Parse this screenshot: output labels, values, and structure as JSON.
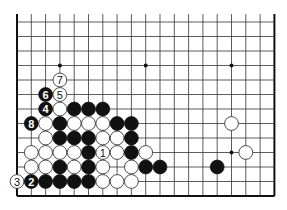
{
  "diagram": {
    "type": "go-board-partial",
    "columns": 19,
    "rows_visible": 13,
    "open_edge": "top",
    "grid": {
      "x0": 17,
      "y0": 22,
      "dx": 14.3,
      "dy": 14.5,
      "top_line_stub_y": 14
    },
    "colors": {
      "line": "#333333",
      "edge": "#111111",
      "black": "#111111",
      "white": "#ffffff",
      "white_stroke": "#222222"
    },
    "star_points": [
      [
        3,
        3
      ],
      [
        9,
        3
      ],
      [
        15,
        3
      ],
      [
        15,
        9
      ]
    ],
    "stones": [
      {
        "c": 3,
        "r": 4,
        "color": "white",
        "label": "7"
      },
      {
        "c": 2,
        "r": 5,
        "color": "black",
        "label": "6"
      },
      {
        "c": 3,
        "r": 5,
        "color": "white",
        "label": "5"
      },
      {
        "c": 2,
        "r": 6,
        "color": "black",
        "label": "4"
      },
      {
        "c": 3,
        "r": 6,
        "color": "white",
        "label": ""
      },
      {
        "c": 4,
        "r": 6,
        "color": "black",
        "label": ""
      },
      {
        "c": 5,
        "r": 6,
        "color": "black",
        "label": ""
      },
      {
        "c": 6,
        "r": 6,
        "color": "black",
        "label": ""
      },
      {
        "c": 1,
        "r": 7,
        "color": "black",
        "label": "8"
      },
      {
        "c": 2,
        "r": 7,
        "color": "white",
        "label": ""
      },
      {
        "c": 3,
        "r": 7,
        "color": "black",
        "label": ""
      },
      {
        "c": 4,
        "r": 7,
        "color": "white",
        "label": ""
      },
      {
        "c": 5,
        "r": 7,
        "color": "white",
        "label": ""
      },
      {
        "c": 6,
        "r": 7,
        "color": "white",
        "label": ""
      },
      {
        "c": 7,
        "r": 7,
        "color": "black",
        "label": ""
      },
      {
        "c": 8,
        "r": 7,
        "color": "black",
        "label": ""
      },
      {
        "c": 15,
        "r": 7,
        "color": "white",
        "label": ""
      },
      {
        "c": 2,
        "r": 8,
        "color": "white",
        "label": ""
      },
      {
        "c": 3,
        "r": 8,
        "color": "black",
        "label": ""
      },
      {
        "c": 4,
        "r": 8,
        "color": "black",
        "label": ""
      },
      {
        "c": 5,
        "r": 8,
        "color": "black",
        "label": ""
      },
      {
        "c": 6,
        "r": 8,
        "color": "white",
        "label": ""
      },
      {
        "c": 7,
        "r": 8,
        "color": "white",
        "label": ""
      },
      {
        "c": 8,
        "r": 8,
        "color": "black",
        "label": ""
      },
      {
        "c": 1,
        "r": 9,
        "color": "white",
        "label": ""
      },
      {
        "c": 2,
        "r": 9,
        "color": "white",
        "label": ""
      },
      {
        "c": 3,
        "r": 9,
        "color": "white",
        "label": ""
      },
      {
        "c": 4,
        "r": 9,
        "color": "white",
        "label": ""
      },
      {
        "c": 5,
        "r": 9,
        "color": "black",
        "label": ""
      },
      {
        "c": 6,
        "r": 9,
        "color": "white",
        "label": "1"
      },
      {
        "c": 7,
        "r": 9,
        "color": "white",
        "label": ""
      },
      {
        "c": 8,
        "r": 9,
        "color": "black",
        "label": ""
      },
      {
        "c": 9,
        "r": 9,
        "color": "white",
        "label": ""
      },
      {
        "c": 16,
        "r": 9,
        "color": "white",
        "label": ""
      },
      {
        "c": 1,
        "r": 10,
        "color": "white",
        "label": ""
      },
      {
        "c": 2,
        "r": 10,
        "color": "white",
        "label": ""
      },
      {
        "c": 3,
        "r": 10,
        "color": "black",
        "label": ""
      },
      {
        "c": 4,
        "r": 10,
        "color": "white",
        "label": ""
      },
      {
        "c": 5,
        "r": 10,
        "color": "black",
        "label": ""
      },
      {
        "c": 6,
        "r": 10,
        "color": "white",
        "label": ""
      },
      {
        "c": 8,
        "r": 10,
        "color": "white",
        "label": ""
      },
      {
        "c": 9,
        "r": 10,
        "color": "black",
        "label": ""
      },
      {
        "c": 10,
        "r": 10,
        "color": "black",
        "label": ""
      },
      {
        "c": 14,
        "r": 10,
        "color": "black",
        "label": ""
      },
      {
        "c": 0,
        "r": 11,
        "color": "white",
        "label": "3"
      },
      {
        "c": 1,
        "r": 11,
        "color": "black",
        "label": "2"
      },
      {
        "c": 2,
        "r": 11,
        "color": "black",
        "label": ""
      },
      {
        "c": 3,
        "r": 11,
        "color": "black",
        "label": ""
      },
      {
        "c": 4,
        "r": 11,
        "color": "black",
        "label": ""
      },
      {
        "c": 5,
        "r": 11,
        "color": "black",
        "label": ""
      },
      {
        "c": 6,
        "r": 11,
        "color": "white",
        "label": ""
      },
      {
        "c": 7,
        "r": 11,
        "color": "white",
        "label": ""
      },
      {
        "c": 8,
        "r": 11,
        "color": "white",
        "label": ""
      }
    ]
  }
}
